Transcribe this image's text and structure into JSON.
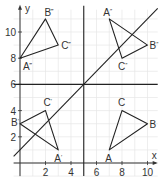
{
  "diagram": {
    "axes": {
      "x_label": "x",
      "y_label": "y",
      "x_ticks": [
        {
          "v": 2,
          "label": "2"
        },
        {
          "v": 4,
          "label": "4"
        },
        {
          "v": 6,
          "label": "6"
        },
        {
          "v": 8,
          "label": "8"
        },
        {
          "v": 10,
          "label": "10"
        }
      ],
      "y_ticks": [
        {
          "v": 2,
          "label": "2"
        },
        {
          "v": 4,
          "label": "4"
        },
        {
          "v": 6,
          "label": "6"
        },
        {
          "v": 8,
          "label": "8"
        },
        {
          "v": 10,
          "label": "10"
        }
      ],
      "x_range": [
        -0.5,
        10.8
      ],
      "y_range": [
        -1,
        12
      ]
    },
    "mirror_lines": [
      {
        "name": "vertical-line-x5",
        "equation": "x = 5",
        "from": [
          5,
          -1
        ],
        "to": [
          5,
          12
        ]
      },
      {
        "name": "horizontal-line-y6",
        "equation": "y = 6",
        "from": [
          -0.5,
          6
        ],
        "to": [
          10.8,
          6
        ]
      },
      {
        "name": "diagonal-line",
        "equation": "y = x + 1",
        "from": [
          -0.5,
          0.5
        ],
        "to": [
          10.8,
          11.8
        ]
      }
    ],
    "triangles": [
      {
        "name": "triangle-abc",
        "vertices": [
          {
            "label": "A",
            "sup": "",
            "x": 7,
            "y": 1,
            "dx": -4,
            "dy": 12
          },
          {
            "label": "B",
            "sup": "",
            "x": 10,
            "y": 3,
            "dx": 2,
            "dy": 4
          },
          {
            "label": "C",
            "sup": "",
            "x": 8,
            "y": 4,
            "dx": -4,
            "dy": -5
          }
        ]
      },
      {
        "name": "triangle-a1b1c1",
        "vertices": [
          {
            "label": "A",
            "sup": "′",
            "x": 3,
            "y": 1,
            "dx": -4,
            "dy": 12
          },
          {
            "label": "B",
            "sup": "′",
            "x": 0,
            "y": 3,
            "dx": -9,
            "dy": 2
          },
          {
            "label": "C",
            "sup": "′",
            "x": 2,
            "y": 4,
            "dx": -2,
            "dy": -5
          }
        ]
      },
      {
        "name": "triangle-a2b2c2",
        "vertices": [
          {
            "label": "A",
            "sup": "″",
            "x": 7,
            "y": 11,
            "dx": -6,
            "dy": -3
          },
          {
            "label": "B",
            "sup": "″",
            "x": 10,
            "y": 9,
            "dx": 2,
            "dy": 4
          },
          {
            "label": "C",
            "sup": "″",
            "x": 8,
            "y": 8,
            "dx": -4,
            "dy": 12
          }
        ]
      },
      {
        "name": "triangle-a3b3c3",
        "vertices": [
          {
            "label": "A",
            "sup": "‴",
            "x": 0,
            "y": 8,
            "dx": 3,
            "dy": 12
          },
          {
            "label": "B",
            "sup": "‴",
            "x": 2,
            "y": 11,
            "dx": -1,
            "dy": -3
          },
          {
            "label": "C",
            "sup": "‴",
            "x": 3,
            "y": 9,
            "dx": 3,
            "dy": 4
          }
        ]
      }
    ],
    "colors": {
      "grid": "#e6e6e6",
      "axis": "#333333",
      "line": "#222222"
    }
  }
}
